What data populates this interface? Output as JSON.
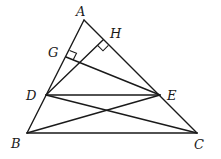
{
  "diagram": {
    "type": "geometry",
    "points": {
      "A": {
        "label": "A",
        "x": 84,
        "y": 20
      },
      "B": {
        "label": "B",
        "x": 27,
        "y": 133
      },
      "C": {
        "label": "C",
        "x": 197,
        "y": 133
      },
      "D": {
        "label": "D",
        "x": 46,
        "y": 95
      },
      "E": {
        "label": "E",
        "x": 160,
        "y": 95
      },
      "G": {
        "label": "G",
        "x": 66,
        "y": 57
      },
      "H": {
        "label": "H",
        "x": 103,
        "y": 40
      }
    },
    "segments": [
      "AB",
      "AC",
      "BC",
      "DE",
      "DC",
      "BE",
      "DH",
      "EG"
    ],
    "right_angles": [
      "G (EG ⊥ AB)",
      "H (DH ⊥ AC)"
    ],
    "labels": {
      "A": "A",
      "B": "B",
      "C": "C",
      "D": "D",
      "E": "E",
      "G": "G",
      "H": "H"
    }
  }
}
